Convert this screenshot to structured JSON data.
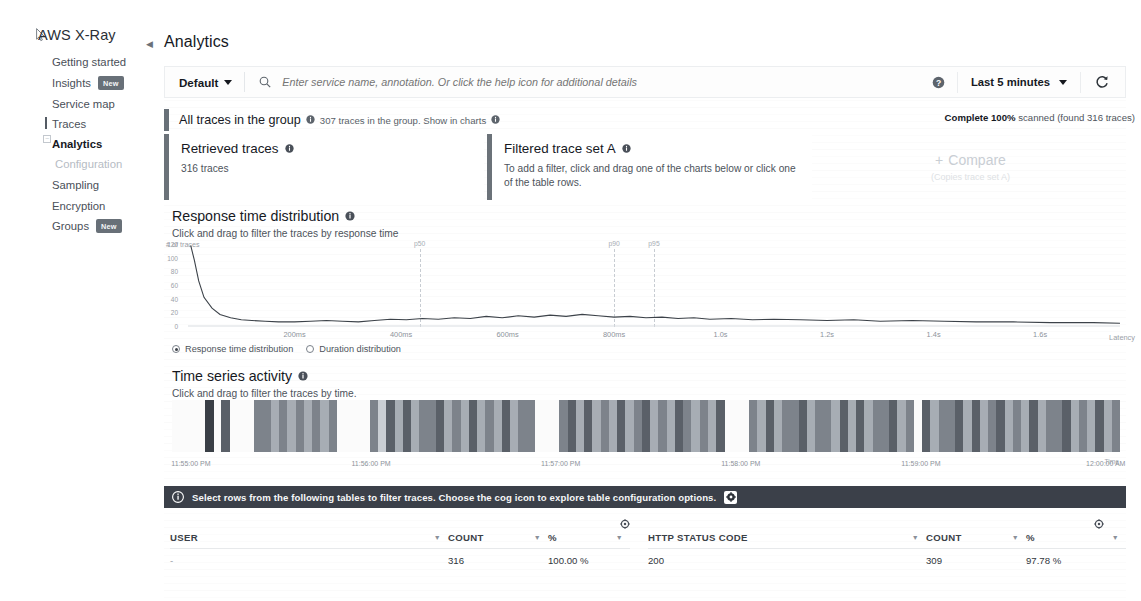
{
  "sidebar": {
    "brand": "AWS X-Ray",
    "items": [
      {
        "label": "Getting started",
        "badge": null,
        "active": false,
        "muted": false
      },
      {
        "label": "Insights",
        "badge": "New",
        "active": false,
        "muted": false
      },
      {
        "label": "Service map",
        "badge": null,
        "active": false,
        "muted": false
      },
      {
        "label": "Traces",
        "badge": null,
        "active": false,
        "muted": false
      },
      {
        "label": "Analytics",
        "badge": null,
        "active": true,
        "muted": false
      },
      {
        "label": "Configuration",
        "badge": null,
        "active": false,
        "muted": true
      },
      {
        "label": "Sampling",
        "badge": null,
        "active": false,
        "muted": false
      },
      {
        "label": "Encryption",
        "badge": null,
        "active": false,
        "muted": false
      },
      {
        "label": "Groups",
        "badge": "New",
        "active": false,
        "muted": false
      }
    ]
  },
  "header": {
    "title": "Analytics"
  },
  "toolbar": {
    "filter_label": "Default",
    "search_placeholder": "Enter service name, annotation. Or click the help icon for additional details",
    "time_range": "Last 5 minutes",
    "help_icon": "help-icon",
    "refresh_icon": "refresh-icon",
    "search_icon": "search-icon",
    "caret_icon": "chevron-down-icon"
  },
  "group_bar": {
    "title": "All traces in the group",
    "subtitle": "307 traces in the group. Show in charts",
    "scan_status_bold": "Complete 100%",
    "scan_status_rest": " scanned (found 316 traces)"
  },
  "cards": {
    "retrieved": {
      "title": "Retrieved traces",
      "value": "316 traces"
    },
    "filtered": {
      "title": "Filtered trace set A",
      "value": "To add a filter, click and drag one of the charts below or click one of the table rows."
    },
    "compare": {
      "label": "Compare",
      "sub": "(Copies trace set A)",
      "plus": "+"
    }
  },
  "response_time": {
    "title": "Response time distribution",
    "subtitle": "Click and drag to filter the traces by response time",
    "radio_primary": "Response time distribution",
    "radio_secondary": "Duration distribution"
  },
  "time_series": {
    "title": "Time series activity",
    "subtitle": "Click and drag to filter the traces by time.",
    "time_axis_label": "Time"
  },
  "info_banner": {
    "text": "Select rows from the following tables to filter traces. Choose the cog icon to explore table configuration options.",
    "info_icon": "info-icon",
    "cog_icon": "gear-icon"
  },
  "tables": [
    {
      "name": "user-table",
      "columns": [
        "USER",
        "COUNT",
        "%"
      ],
      "rows": [
        [
          "-",
          "316",
          "100.00 %"
        ]
      ]
    },
    {
      "name": "http-status-code-table",
      "columns": [
        "HTTP STATUS CODE",
        "COUNT",
        "%"
      ],
      "rows": [
        [
          "200",
          "309",
          "97.78 %"
        ]
      ]
    }
  ],
  "chart_data": [
    {
      "type": "line",
      "name": "response-time-distribution",
      "title": "Response time distribution",
      "xlabel": "Latency",
      "ylabel": "# of traces",
      "xlim": [
        0,
        1.75
      ],
      "ylim": [
        0,
        120
      ],
      "xtick_labels": [
        "200ms",
        "400ms",
        "600ms",
        "800ms",
        "1.0s",
        "1.2s",
        "1.4s",
        "1.6s"
      ],
      "xtick_values": [
        0.2,
        0.4,
        0.6,
        0.8,
        1.0,
        1.2,
        1.4,
        1.6
      ],
      "ytick_labels": [
        "120",
        "100",
        "80",
        "60",
        "40",
        "20",
        "0"
      ],
      "ytick_values": [
        120,
        100,
        80,
        60,
        40,
        20,
        0
      ],
      "grid": false,
      "annotations": [
        {
          "label": "p50",
          "x": 0.435
        },
        {
          "label": "p90",
          "x": 0.8
        },
        {
          "label": "p95",
          "x": 0.875
        }
      ],
      "x": [
        0.005,
        0.012,
        0.02,
        0.03,
        0.045,
        0.06,
        0.08,
        0.1,
        0.12,
        0.145,
        0.17,
        0.2,
        0.23,
        0.26,
        0.29,
        0.32,
        0.35,
        0.38,
        0.41,
        0.44,
        0.47,
        0.5,
        0.53,
        0.56,
        0.59,
        0.62,
        0.65,
        0.68,
        0.71,
        0.74,
        0.77,
        0.8,
        0.83,
        0.86,
        0.89,
        0.92,
        0.95,
        0.98,
        1.02,
        1.06,
        1.1,
        1.15,
        1.2,
        1.25,
        1.3,
        1.36,
        1.42,
        1.48,
        1.55,
        1.62,
        1.7,
        1.75
      ],
      "y": [
        118,
        96,
        66,
        42,
        26,
        17,
        12,
        9,
        8,
        7,
        6,
        6,
        7,
        8,
        7,
        6,
        8,
        10,
        9,
        11,
        10,
        12,
        11,
        14,
        12,
        15,
        13,
        16,
        14,
        17,
        15,
        13,
        14,
        12,
        13,
        11,
        12,
        10,
        11,
        9,
        10,
        9,
        8,
        9,
        7,
        8,
        7,
        6,
        6,
        5,
        5,
        4
      ]
    },
    {
      "type": "bar",
      "name": "time-series-activity",
      "title": "Time series activity",
      "xlabel": "Time",
      "ylabel": "",
      "xtick_labels": [
        "11:55:00 PM",
        "11:56:00 PM",
        "11:57:00 PM",
        "11:58:00 PM",
        "11:59:00 PM",
        "12:00:00 AM"
      ],
      "xtick_positions": [
        0.02,
        0.21,
        0.41,
        0.6,
        0.79,
        0.985
      ],
      "grid": false,
      "values": [
        0.0,
        0.0,
        0.0,
        0.0,
        0.92,
        0.0,
        0.88,
        0.0,
        0.0,
        0.0,
        0.52,
        0.55,
        0.48,
        0.62,
        0.5,
        0.58,
        0.45,
        0.6,
        0.38,
        0.55,
        0.0,
        0.0,
        0.0,
        0.0,
        0.62,
        0.3,
        0.75,
        0.4,
        0.85,
        0.35,
        0.7,
        0.55,
        0.8,
        0.45,
        0.68,
        0.38,
        0.72,
        0.5,
        0.6,
        0.42,
        0.78,
        0.33,
        0.65,
        0.52,
        0.0,
        0.0,
        0.0,
        0.58,
        0.72,
        0.44,
        0.8,
        0.36,
        0.68,
        0.5,
        0.75,
        0.4,
        0.62,
        0.85,
        0.33,
        0.7,
        0.48,
        0.78,
        0.55,
        0.42,
        0.66,
        0.38,
        0.73,
        0.0,
        0.0,
        0.0,
        0.64,
        0.46,
        0.82,
        0.35,
        0.7,
        0.52,
        0.76,
        0.41,
        0.68,
        0.58,
        0.33,
        0.74,
        0.49,
        0.8,
        0.37,
        0.66,
        0.55,
        0.71,
        0.44,
        0.62,
        0.0,
        0.78,
        0.4,
        0.68,
        0.53,
        0.84,
        0.36,
        0.72,
        0.47,
        0.61,
        0.79,
        0.34,
        0.7,
        0.5,
        0.75,
        0.42,
        0.65,
        0.57,
        0.81,
        0.39,
        0.69,
        0.46,
        0.73,
        0.35,
        0.6
      ]
    }
  ]
}
